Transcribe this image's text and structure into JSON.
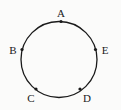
{
  "figure": {
    "type": "geometry-diagram",
    "background_color": "#fbfbfa",
    "stroke_color": "#1a1a1a",
    "label_color": "#1a1a1a",
    "canvas": {
      "width": 121,
      "height": 110
    },
    "circle": {
      "name": "circle",
      "center_x": 59,
      "center_y": 59.5,
      "radius": 38,
      "stroke_width": 1.3
    },
    "point_marker": {
      "shape": "filled-dot",
      "radius": 1.6,
      "fill": "#1a1a1a"
    },
    "points": [
      {
        "id": "A",
        "label": "A",
        "dot_x": 61,
        "dot_y": 21.5,
        "label_x": 61,
        "label_y": 13,
        "angle_deg": 95
      },
      {
        "id": "B",
        "label": "B",
        "dot_x": 22,
        "dot_y": 49.5,
        "label_x": 13,
        "label_y": 50,
        "angle_deg": 165
      },
      {
        "id": "C",
        "label": "C",
        "dot_x": 36,
        "dot_y": 89,
        "label_x": 31,
        "label_y": 98,
        "angle_deg": 231
      },
      {
        "id": "D",
        "label": "D",
        "dot_x": 80,
        "dot_y": 89,
        "label_x": 87,
        "label_y": 98,
        "angle_deg": 309
      },
      {
        "id": "E",
        "label": "E",
        "dot_x": 95.5,
        "dot_y": 49.5,
        "label_x": 105,
        "label_y": 50,
        "angle_deg": 15
      }
    ]
  }
}
